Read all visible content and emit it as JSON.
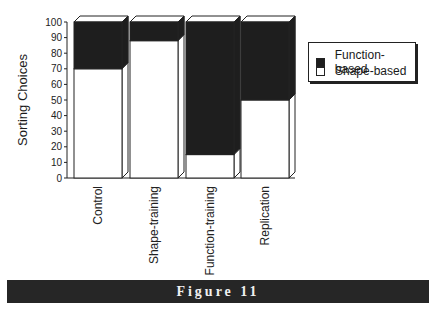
{
  "chart_data": {
    "type": "bar",
    "stacked": true,
    "style": "3d",
    "title": "",
    "xlabel": "",
    "ylabel": "Sorting Choices",
    "ylim": [
      0,
      100
    ],
    "yticks": [
      0,
      10,
      20,
      30,
      40,
      50,
      60,
      70,
      80,
      90,
      100
    ],
    "grid": false,
    "legend_position": "right",
    "categories": [
      "Control",
      "Shape-training",
      "Function-training",
      "Replication"
    ],
    "series": [
      {
        "name": "Shape-based",
        "color": "#ffffff",
        "values": [
          70,
          88,
          15,
          50
        ]
      },
      {
        "name": "Function-based",
        "color": "#1e1e1e",
        "values": [
          30,
          12,
          85,
          50
        ]
      }
    ]
  },
  "legend": {
    "items": [
      {
        "label": "Function-based",
        "color": "#1e1e1e"
      },
      {
        "label": "Shape-based",
        "color": "#ffffff"
      }
    ]
  },
  "caption": "Figure 11"
}
